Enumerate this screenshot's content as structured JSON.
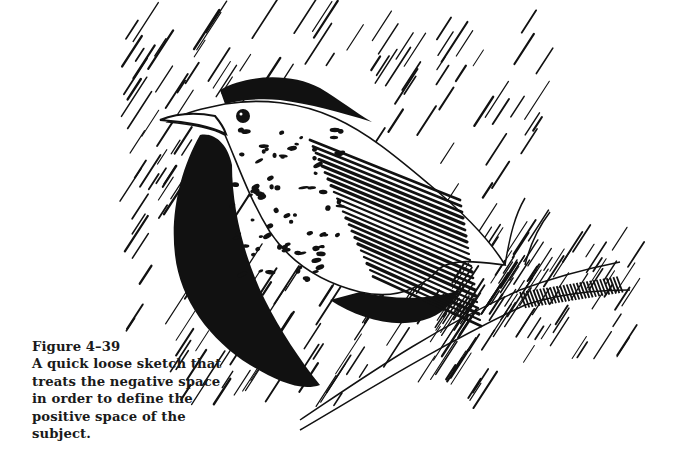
{
  "figure": {
    "number": "Figure 4–39",
    "caption_lines": [
      "A quick loose sketch that",
      "treats the negative space",
      "in order to define the",
      "positive space of the",
      "subject."
    ],
    "illustration": "pen-and-ink sketch of a speckled thrush perched on a branch",
    "colors": {
      "ink": "#111111",
      "paper": "#ffffff"
    }
  }
}
